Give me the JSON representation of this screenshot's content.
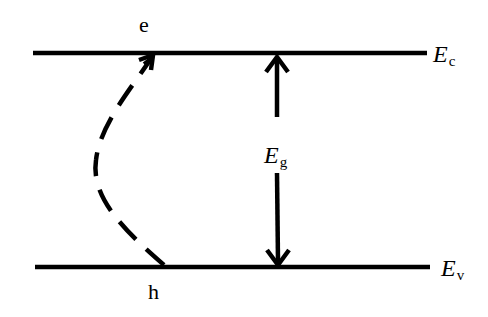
{
  "diagram": {
    "title": "",
    "colors": {
      "background": "#ffffff",
      "stroke": "#000000"
    },
    "levels": [
      {
        "id": "conduction-band",
        "symbol": "E",
        "subscript": "c",
        "y": 53,
        "x1": 33,
        "x2": 427
      },
      {
        "id": "valence-band",
        "symbol": "E",
        "subscript": "v",
        "y": 267,
        "x1": 35,
        "x2": 430
      }
    ],
    "carriers": {
      "electron": "e",
      "hole": "h"
    },
    "band_gap": {
      "symbol": "E",
      "subscript": "g",
      "arrow": "double-headed",
      "x": 277
    },
    "transition": {
      "style": "dashed",
      "from": "h",
      "to": "e",
      "direction": "upward"
    }
  }
}
